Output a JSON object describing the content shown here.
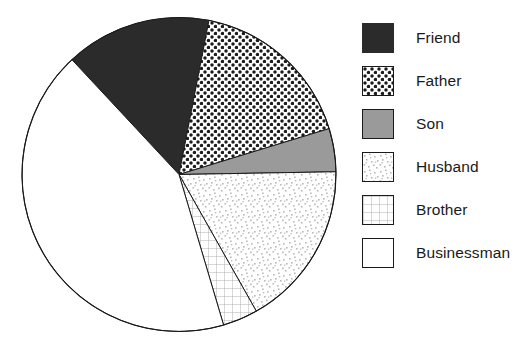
{
  "chart_data": {
    "type": "pie",
    "title": "",
    "categories": [
      "Friend",
      "Father",
      "Son",
      "Husband",
      "Brother",
      "Businessman"
    ],
    "values": [
      15.0,
      17.2,
      4.4,
      17.1,
      3.6,
      42.7
    ],
    "units": "percent",
    "legend_position": "right",
    "grid": false,
    "slices": [
      {
        "label": "Friend",
        "value": 15.0,
        "start_angle": 227.0,
        "end_angle": 281.0,
        "pattern": "solid-dark",
        "color": "#2b2b2b",
        "outline": "#2b2b2b"
      },
      {
        "label": "Father",
        "value": 17.2,
        "start_angle": 281.0,
        "end_angle": 343.0,
        "pattern": "polka-dots",
        "color": "#ffffff",
        "outline": "#1a1a1a"
      },
      {
        "label": "Son",
        "value": 4.4,
        "start_angle": 343.0,
        "end_angle": 359.0,
        "pattern": "solid-gray",
        "color": "#9a9a9a",
        "outline": "#1a1a1a"
      },
      {
        "label": "Husband",
        "value": 17.1,
        "start_angle": 359.0,
        "end_angle": 420.5,
        "pattern": "fine-speckle",
        "color": "#ffffff",
        "outline": "#1a1a1a"
      },
      {
        "label": "Brother",
        "value": 3.6,
        "start_angle": 420.5,
        "end_angle": 433.5,
        "pattern": "grid",
        "color": "#ffffff",
        "outline": "#1a1a1a"
      },
      {
        "label": "Businessman",
        "value": 42.7,
        "start_angle": 433.5,
        "end_angle": 587.0,
        "pattern": "plain-white",
        "color": "#ffffff",
        "outline": "#1a1a1a"
      }
    ],
    "geometry": {
      "center_x": 179,
      "center_y": 174.5,
      "radius": 157
    }
  },
  "legend": {
    "items": [
      {
        "label": "Friend",
        "swatch": "swatch-solid-dark"
      },
      {
        "label": "Father",
        "swatch": "swatch-polka-dots"
      },
      {
        "label": "Son",
        "swatch": "swatch-solid-gray"
      },
      {
        "label": "Husband",
        "swatch": "swatch-fine-speckle"
      },
      {
        "label": "Brother",
        "swatch": "swatch-grid"
      },
      {
        "label": "Businessman",
        "swatch": "swatch-plain-white"
      }
    ]
  }
}
